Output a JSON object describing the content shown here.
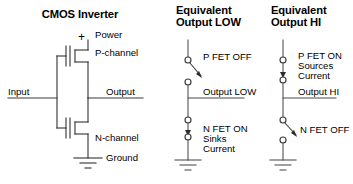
{
  "figure": {
    "panels": [
      {
        "id": "cmos-inverter",
        "title": "CMOS Inverter",
        "labels": {
          "power": "Power",
          "plus": "+",
          "p_channel": "P-channel",
          "input": "Input",
          "output": "Output",
          "n_channel": "N-channel",
          "ground": "Ground"
        }
      },
      {
        "id": "equivalent-output-low",
        "title_line1": "Equivalent",
        "title_line2": "Output LOW",
        "labels": {
          "top_switch": "P FET OFF",
          "output": "Output LOW",
          "bottom_switch_line1": "N FET ON",
          "bottom_switch_line2": "Sinks",
          "bottom_switch_line3": "Current"
        },
        "states": {
          "top_switch": "open",
          "bottom_switch": "closed"
        }
      },
      {
        "id": "equivalent-output-hi",
        "title_line1": "Equivalent",
        "title_line2": "Output HI",
        "labels": {
          "top_switch_line1": "P FET ON",
          "top_switch_line2": "Sources",
          "top_switch_line3": "Current",
          "output": "Output HI",
          "bottom_switch": "N FET OFF"
        },
        "states": {
          "top_switch": "closed",
          "bottom_switch": "open"
        }
      }
    ],
    "colors": {
      "background": "#ffffff",
      "text": "#231f20",
      "wire": "#3a3a3c"
    }
  }
}
